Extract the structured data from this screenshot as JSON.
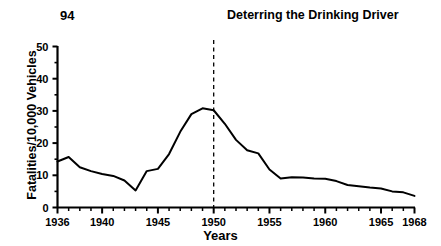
{
  "header": {
    "page_number": "94",
    "running_head": "Deterring the Drinking Driver"
  },
  "chart_data": {
    "type": "line",
    "title": "",
    "xlabel": "Years",
    "ylabel": "Fatalities/10,000 Vehicles",
    "xlim": [
      1936,
      1968
    ],
    "ylim": [
      0,
      50
    ],
    "ytick_labels": [
      "0",
      "10",
      "20",
      "30",
      "40",
      "50"
    ],
    "ytick_values": [
      0,
      10,
      20,
      30,
      40,
      50
    ],
    "ytick_minor_values": [
      5,
      15,
      25,
      35,
      45
    ],
    "xtick_labels": [
      "1936",
      "1940",
      "1945",
      "1950",
      "1955",
      "1960",
      "1965",
      "1968"
    ],
    "xtick_values": [
      1936,
      1940,
      1945,
      1950,
      1955,
      1960,
      1965,
      1968
    ],
    "grid": false,
    "legend": null,
    "line_color": "#000000",
    "line_width": 2.0,
    "annotations": [
      {
        "name": "reference-line-1950",
        "type": "vline",
        "x": 1950,
        "style": "dashed",
        "color": "#000000"
      }
    ],
    "x": [
      1936,
      1937,
      1938,
      1939,
      1940,
      1941,
      1942,
      1943,
      1944,
      1945,
      1946,
      1947,
      1948,
      1949,
      1950,
      1951,
      1952,
      1953,
      1954,
      1955,
      1956,
      1957,
      1958,
      1959,
      1960,
      1961,
      1962,
      1963,
      1964,
      1965,
      1966,
      1967,
      1968
    ],
    "values": [
      14.3,
      15.7,
      12.5,
      11.3,
      10.4,
      9.8,
      8.4,
      5.3,
      11.3,
      12.0,
      16.6,
      23.5,
      29.0,
      30.8,
      30.2,
      26.0,
      21.0,
      17.8,
      16.8,
      11.8,
      9.0,
      9.4,
      9.3,
      9.0,
      8.9,
      8.2,
      7.0,
      6.6,
      6.2,
      5.9,
      5.0,
      4.7,
      3.6
    ]
  }
}
